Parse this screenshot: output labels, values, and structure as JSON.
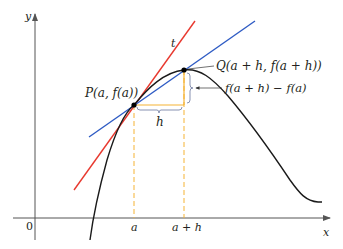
{
  "figure": {
    "colors": {
      "axis": "#555555",
      "curve": "#1a1a1a",
      "tangent": "#e8392f",
      "secant": "#2e5bc4",
      "guide": "#f5b335",
      "bracket": "#7a86a8",
      "point": "#000000"
    },
    "axes": {
      "x_label": "x",
      "y_label": "y",
      "origin_label": "0",
      "x_ticks": [
        {
          "label": "a"
        },
        {
          "label": "a + h"
        }
      ]
    },
    "labels": {
      "tangent": "t",
      "point_p": "P(a, f(a))",
      "point_q": "Q(a + h, f(a + h))",
      "rise": "f(a + h) − f(a)",
      "run": "h"
    }
  }
}
